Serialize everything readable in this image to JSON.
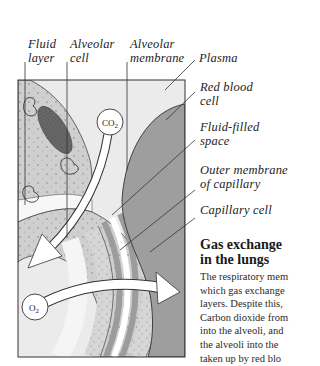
{
  "labels": {
    "fluid_layer": [
      "Fluid",
      "layer"
    ],
    "alveolar_cell": [
      "Alveolar",
      "cell"
    ],
    "alveolar_membrane": [
      "Alveolar",
      "membrane"
    ],
    "plasma": [
      "Plasma"
    ],
    "red_blood_cell": [
      "Red blood",
      "cell"
    ],
    "fluid_filled_space": [
      "Fluid-filled",
      "space"
    ],
    "outer_membrane": [
      "Outer membrane",
      "of capillary"
    ],
    "capillary_cell": [
      "Capillary cell"
    ]
  },
  "molecules": {
    "co2": {
      "base": "CO",
      "sub": "2"
    },
    "o2": {
      "base": "O",
      "sub": "2"
    }
  },
  "caption": {
    "title": [
      "Gas exchange",
      "in the lungs"
    ],
    "lines": [
      "The respiratory mem",
      "which gas exchange",
      "layers. Despite this,",
      "Carbon dioxide from",
      "into the alveoli, and",
      "the alveoli into the",
      "taken up by red blo"
    ]
  },
  "colors": {
    "background": "#ffffff",
    "alveolar_space": "#ebebeb",
    "alveolar_cell": "#c8c8c8",
    "membrane_band": "#9c9c9c",
    "fluid_space": "#d9d9d9",
    "red_blood_cell": "#9e9e9e",
    "nucleus": "#5a5a5a",
    "arrow": "#ffffff",
    "outline": "#333333"
  }
}
